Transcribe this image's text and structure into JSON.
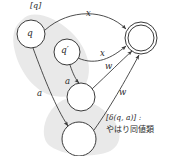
{
  "figure": {
    "type": "automaton-equivalence-class-diagram",
    "background_color": "#ffffff",
    "stroke_color": "#3a3a3a",
    "blob_color": "#e8e8e8",
    "text_color": "#2b2b2b"
  },
  "nodes": [
    {
      "id": "q",
      "label": "q",
      "cx": 31,
      "cy": 34,
      "r": 14,
      "accepting": false
    },
    {
      "id": "qprime",
      "label": "q′",
      "cx": 67,
      "cy": 52,
      "r": 13,
      "accepting": false
    },
    {
      "id": "mid",
      "label": "",
      "cx": 81,
      "cy": 97,
      "r": 14,
      "accepting": false
    },
    {
      "id": "bot",
      "label": "",
      "cx": 79,
      "cy": 139,
      "r": 17,
      "accepting": false
    },
    {
      "id": "accept",
      "label": "",
      "cx": 141,
      "cy": 38,
      "r": 16,
      "accepting": true
    }
  ],
  "edges": [
    {
      "id": "q-to-accept",
      "from": "q",
      "to": "accept",
      "label": "x"
    },
    {
      "id": "qprime-to-accept",
      "from": "q′",
      "to": "accept",
      "label": "x"
    },
    {
      "id": "q-to-bot",
      "from": "q",
      "to": "bot",
      "label": "a"
    },
    {
      "id": "qprime-to-mid",
      "from": "q′",
      "to": "mid",
      "label": "a"
    },
    {
      "id": "mid-to-accept",
      "from": "mid",
      "to": "accept",
      "label": "w"
    },
    {
      "id": "bot-to-accept",
      "from": "bot",
      "to": "accept",
      "label": "w"
    }
  ],
  "labels": {
    "class_top": "[q]",
    "node_q": "q",
    "node_qprime": "q′",
    "edge_x_top": "x",
    "edge_x_mid": "x",
    "edge_a_left": "a",
    "edge_a_mid": "a",
    "edge_w_upper": "w",
    "edge_w_lower": "w"
  },
  "caption": {
    "line1": "[δ(q, a)] :",
    "line2": "やはり同値類"
  }
}
